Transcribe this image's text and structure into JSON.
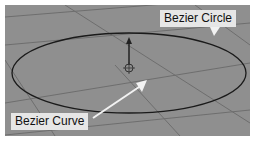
{
  "viewport": {
    "background": "#8f8f8f",
    "grid_color": "#6e6e6e",
    "curve_color": "#1a1a1a"
  },
  "labels": {
    "circle": "Bezier Circle",
    "curve": "Bezier Curve"
  },
  "colors": {
    "label_bg": "#e6e6e6",
    "arrow": "#f2f2f2"
  }
}
